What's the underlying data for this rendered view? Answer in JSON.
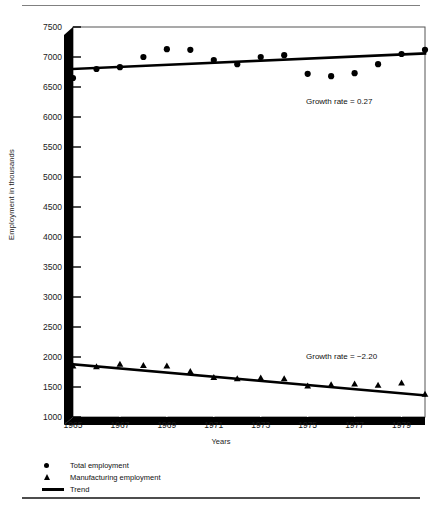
{
  "chart_data": {
    "type": "scatter",
    "title": "",
    "xlabel": "Years",
    "ylabel": "Employment in thousands",
    "xlim": [
      1965,
      1980
    ],
    "ylim": [
      1000,
      7500
    ],
    "xticks": [
      1965,
      1967,
      1969,
      1971,
      1973,
      1975,
      1977,
      1979
    ],
    "xtick_labels": [
      "1965",
      "1967",
      "1969",
      "1971",
      "1973",
      "1975",
      "1977",
      "1979"
    ],
    "yticks": [
      1000,
      1500,
      2000,
      2500,
      3000,
      3500,
      4000,
      4500,
      5000,
      5500,
      6000,
      6500,
      7000,
      7500
    ],
    "ytick_labels": [
      "1000",
      "1500",
      "2000",
      "2500",
      "3000",
      "3500",
      "4000",
      "4500",
      "5000",
      "5500",
      "6000",
      "6500",
      "7000",
      "7500"
    ],
    "grid": false,
    "legend_position": "below-axes",
    "series": [
      {
        "name": "Total employment",
        "marker": "circle",
        "x": [
          1965,
          1966,
          1967,
          1968,
          1969,
          1970,
          1971,
          1972,
          1973,
          1974,
          1975,
          1976,
          1977,
          1978,
          1979,
          1980
        ],
        "values": [
          6650,
          6800,
          6830,
          7000,
          7130,
          7120,
          6950,
          6880,
          7000,
          7030,
          6720,
          6680,
          6730,
          6880,
          7050,
          7120
        ]
      },
      {
        "name": "Manufacturing employment",
        "marker": "triangle",
        "x": [
          1965,
          1966,
          1967,
          1968,
          1969,
          1970,
          1971,
          1972,
          1973,
          1974,
          1975,
          1976,
          1977,
          1978,
          1979,
          1980
        ],
        "values": [
          1850,
          1840,
          1880,
          1860,
          1850,
          1760,
          1660,
          1640,
          1650,
          1640,
          1520,
          1540,
          1550,
          1530,
          1570,
          1380
        ]
      },
      {
        "name": "Trend",
        "marker": "line",
        "lines": [
          {
            "label": "total-trend",
            "x": [
              1965,
              1980
            ],
            "values": [
              6800,
              7060
            ]
          },
          {
            "label": "manufacturing-trend",
            "x": [
              1965,
              1980
            ],
            "values": [
              1880,
              1360
            ]
          }
        ]
      }
    ],
    "annotations": [
      {
        "text": "Growth rate = 0.27",
        "value": 0.27,
        "series": "Total employment"
      },
      {
        "text": "Growth rate = −2.20",
        "value": -2.2,
        "series": "Manufacturing employment"
      }
    ],
    "legend": [
      {
        "label": "Total employment",
        "symbol": "circle"
      },
      {
        "label": "Manufacturing employment",
        "symbol": "triangle"
      },
      {
        "label": "Trend",
        "symbol": "line"
      }
    ],
    "colors": {
      "marker": "#000000",
      "trend_line": "#000000",
      "axis": "#000000",
      "background": "#ffffff",
      "rule": "#808080"
    }
  }
}
